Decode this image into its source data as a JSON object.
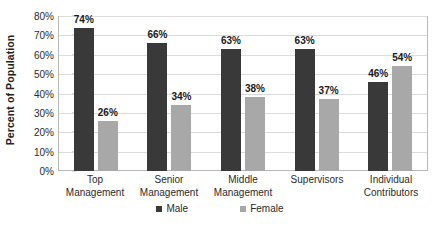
{
  "chart_data": {
    "type": "bar",
    "title": "",
    "subtitle": "",
    "xlabel": "",
    "ylabel": "Percent of Population",
    "categories": [
      "Top Management",
      "Senior Management",
      "Middle Management",
      "Supervisors",
      "Individual Contributors"
    ],
    "category_lines": [
      [
        "Top",
        "Management"
      ],
      [
        "Senior",
        "Management"
      ],
      [
        "Middle",
        "Management"
      ],
      [
        "Supervisors",
        ""
      ],
      [
        "Individual",
        "Contributors"
      ]
    ],
    "series": [
      {
        "name": "Male",
        "color": "#393939",
        "values": [
          74,
          66,
          63,
          63,
          46
        ],
        "labels": [
          "74%",
          "66%",
          "63%",
          "63%",
          "46%"
        ]
      },
      {
        "name": "Female",
        "color": "#a8a8a8",
        "values": [
          26,
          34,
          38,
          37,
          54
        ],
        "labels": [
          "26%",
          "34%",
          "38%",
          "37%",
          "54%"
        ]
      }
    ],
    "ylim": [
      0,
      80
    ],
    "ytick_step": 10,
    "ytick_labels": [
      "80%",
      "70%",
      "60%",
      "50%",
      "40%",
      "30%",
      "20%",
      "10%",
      "0%"
    ],
    "ytick_values": [
      80,
      70,
      60,
      50,
      40,
      30,
      20,
      10,
      0
    ],
    "grid": true,
    "legend_position": "bottom",
    "legend": [
      "Male",
      "Female"
    ],
    "value_suffix": "%",
    "colors": {
      "male": "#393939",
      "female": "#a8a8a8",
      "gridline": "#dcdcdc",
      "axis": "#b9b9b9",
      "text": "#2b2b2b",
      "background": "#ffffff"
    }
  }
}
